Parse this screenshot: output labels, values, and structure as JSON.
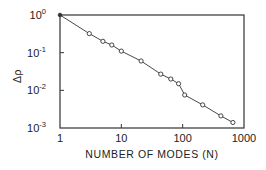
{
  "chart_data": {
    "type": "line",
    "title": "",
    "xlabel": "NUMBER OF MODES (N)",
    "ylabel": "Δρ",
    "xscale": "log",
    "yscale": "log",
    "xlim": [
      1,
      1000
    ],
    "ylim": [
      0.001,
      1
    ],
    "grid": false,
    "legend": null,
    "x_ticks": [
      "1",
      "10",
      "100",
      "1000"
    ],
    "y_ticks": [
      {
        "base": "10",
        "exp": "0"
      },
      {
        "base": "10",
        "exp": "-1"
      },
      {
        "base": "10",
        "exp": "-2"
      },
      {
        "base": "10",
        "exp": "-3"
      }
    ],
    "series": [
      {
        "name": "Δρ vs N",
        "marker": "open-circle",
        "line": "solid",
        "x": [
          1,
          3,
          5,
          7,
          10,
          21,
          44,
          64,
          86,
          108,
          212,
          420,
          660
        ],
        "y": [
          1.0,
          0.32,
          0.2,
          0.16,
          0.11,
          0.06,
          0.027,
          0.02,
          0.015,
          0.0075,
          0.0041,
          0.0021,
          0.0014
        ]
      }
    ],
    "colors": {
      "line": "#333333",
      "frame": "#333333",
      "text": "#222222"
    }
  }
}
